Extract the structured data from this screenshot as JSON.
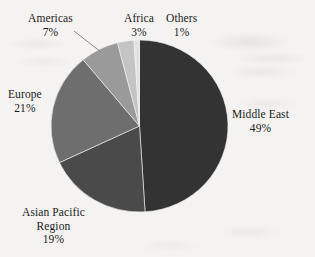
{
  "chart_data": {
    "type": "pie",
    "title": "",
    "subtitle": "",
    "xlabel": "",
    "ylabel": "",
    "legend_position": "none",
    "grid": false,
    "unit": "%",
    "categories": [
      "Middle East",
      "Asian Pacific Region",
      "Europe",
      "Americas",
      "Africa",
      "Others"
    ],
    "values": [
      49,
      19,
      21,
      7,
      3,
      1
    ],
    "slices": [
      {
        "label": "Middle East",
        "label_line1": "Middle East",
        "label_line2": "",
        "value": 49,
        "value_text": "49%",
        "color": "#333333",
        "start_angle_deg": 0,
        "end_angle_deg": 176.4
      },
      {
        "label": "Asian Pacific Region",
        "label_line1": "Asian Pacific",
        "label_line2": "Region",
        "value": 19,
        "value_text": "19%",
        "color": "#4a4a4a",
        "start_angle_deg": 176.4,
        "end_angle_deg": 244.8
      },
      {
        "label": "Europe",
        "label_line1": "Europe",
        "label_line2": "",
        "value": 21,
        "value_text": "21%",
        "color": "#6e6e6e",
        "start_angle_deg": 244.8,
        "end_angle_deg": 320.4
      },
      {
        "label": "Americas",
        "label_line1": "Americas",
        "label_line2": "",
        "value": 7,
        "value_text": "7%",
        "color": "#9a9a9a",
        "start_angle_deg": 320.4,
        "end_angle_deg": 345.6
      },
      {
        "label": "Africa",
        "label_line1": "Africa",
        "label_line2": "",
        "value": 3,
        "value_text": "3%",
        "color": "#c4c4c4",
        "start_angle_deg": 345.6,
        "end_angle_deg": 356.4
      },
      {
        "label": "Others",
        "label_line1": "Others",
        "label_line2": "",
        "value": 1,
        "value_text": "1%",
        "color": "#e2e2e2",
        "start_angle_deg": 356.4,
        "end_angle_deg": 360
      }
    ]
  },
  "colors": {
    "background": "#f4f3f1",
    "text": "#1b1b1b",
    "leader_line": "#8a8a8a",
    "slice_middle_east": "#333333",
    "slice_asian_pacific": "#4a4a4a",
    "slice_europe": "#6e6e6e",
    "slice_americas": "#9a9a9a",
    "slice_africa": "#c4c4c4",
    "slice_others": "#e2e2e2"
  }
}
